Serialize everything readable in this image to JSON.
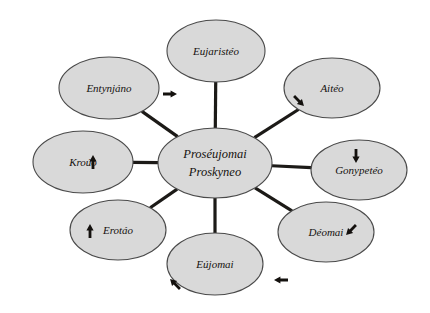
{
  "diagram": {
    "type": "radial-hub-and-spoke",
    "title_visible": false,
    "background_color": "#ffffff",
    "node_fill_color": "#d9d9d9",
    "node_stroke_color": "#4a4a4a",
    "spoke_color": "#1c1a17",
    "text_color": "#15120f",
    "hub": {
      "id": "hub",
      "line1": "Proséujomai",
      "line2": "Proskyneo",
      "cx": 215,
      "cy": 163,
      "rx": 57,
      "ry": 35
    },
    "satellites": [
      {
        "id": "eujaristeo",
        "label": "Eujaristéo",
        "cx": 216,
        "cy": 51,
        "rx": 49,
        "ry": 31,
        "arrow": null
      },
      {
        "id": "aiteo",
        "label": "Aitéo",
        "cx": 332,
        "cy": 88,
        "rx": 48,
        "ry": 30,
        "arrow": {
          "glyph": "arrow-down-right",
          "x": 299,
          "y": 101,
          "rotation": 135
        }
      },
      {
        "id": "gonypeteo",
        "label": "Gonypetéo",
        "cx": 359,
        "cy": 170,
        "rx": 48,
        "ry": 30,
        "arrow": {
          "glyph": "arrow-down",
          "x": 356,
          "y": 156,
          "rotation": 180
        }
      },
      {
        "id": "deomai",
        "label": "Déomai",
        "cx": 326,
        "cy": 232,
        "rx": 48,
        "ry": 30,
        "arrow": {
          "glyph": "arrow-down-left",
          "x": 351,
          "y": 230,
          "rotation": 225
        }
      },
      {
        "id": "eujomai",
        "label": "Eújomai",
        "cx": 215,
        "cy": 264,
        "rx": 48,
        "ry": 31,
        "arrow": {
          "glyph": "arrow-up-left",
          "x": 175,
          "y": 284,
          "rotation": 315
        }
      },
      {
        "id": "erotao",
        "label": "Erotáo",
        "cx": 118,
        "cy": 230,
        "rx": 48,
        "ry": 30,
        "arrow": {
          "glyph": "arrow-up",
          "x": 90,
          "y": 231,
          "rotation": 0
        }
      },
      {
        "id": "krouo",
        "label": "Kroúo",
        "cx": 83,
        "cy": 162,
        "rx": 50,
        "ry": 31,
        "arrow": {
          "glyph": "arrow-up",
          "x": 93,
          "y": 162,
          "rotation": 0
        }
      },
      {
        "id": "entynjano",
        "label": "Entynjáno",
        "cx": 109,
        "cy": 88,
        "rx": 50,
        "ry": 31,
        "arrow": {
          "glyph": "arrow-right",
          "x": 170,
          "y": 94,
          "rotation": 90
        }
      }
    ],
    "extra_arrows": [
      {
        "id": "eujomai-right-arrow",
        "glyph": "arrow-left",
        "x": 281,
        "y": 280,
        "rotation": 270
      }
    ],
    "spokes": [
      {
        "from": "hub",
        "to": "eujaristeo"
      },
      {
        "from": "hub",
        "to": "aiteo"
      },
      {
        "from": "hub",
        "to": "gonypeteo"
      },
      {
        "from": "hub",
        "to": "deomai"
      },
      {
        "from": "hub",
        "to": "eujomai"
      },
      {
        "from": "hub",
        "to": "erotao"
      },
      {
        "from": "hub",
        "to": "krouo"
      },
      {
        "from": "hub",
        "to": "entynjano"
      }
    ]
  }
}
